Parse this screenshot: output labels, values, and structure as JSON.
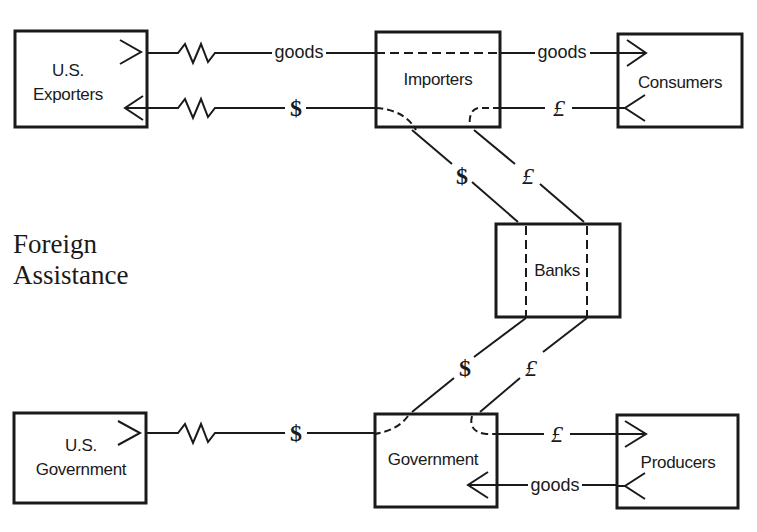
{
  "diagram": {
    "title_line1": "Foreign",
    "title_line2": "Assistance",
    "nodes": {
      "us_exporters": {
        "line1": "U.S.",
        "line2": "Exporters"
      },
      "importers": {
        "label": "Importers"
      },
      "consumers": {
        "label": "Consumers"
      },
      "banks": {
        "label": "Banks"
      },
      "us_government": {
        "line1": "U.S.",
        "line2": "Government"
      },
      "government": {
        "label": "Government"
      },
      "producers": {
        "label": "Producers"
      }
    },
    "flows": {
      "exporters_importers_goods": "goods",
      "importers_exporters_dollar": "$",
      "importers_consumers_goods": "goods",
      "consumers_importers_pound": "£",
      "importers_banks_dollar": "$",
      "importers_banks_pound": "£",
      "banks_government_dollar": "$",
      "banks_government_pound": "£",
      "usgov_government_dollar": "$",
      "government_producers_pound": "£",
      "producers_government_goods": "goods"
    },
    "colors": {
      "ink": "#1a1a1a",
      "background": "#ffffff"
    }
  }
}
